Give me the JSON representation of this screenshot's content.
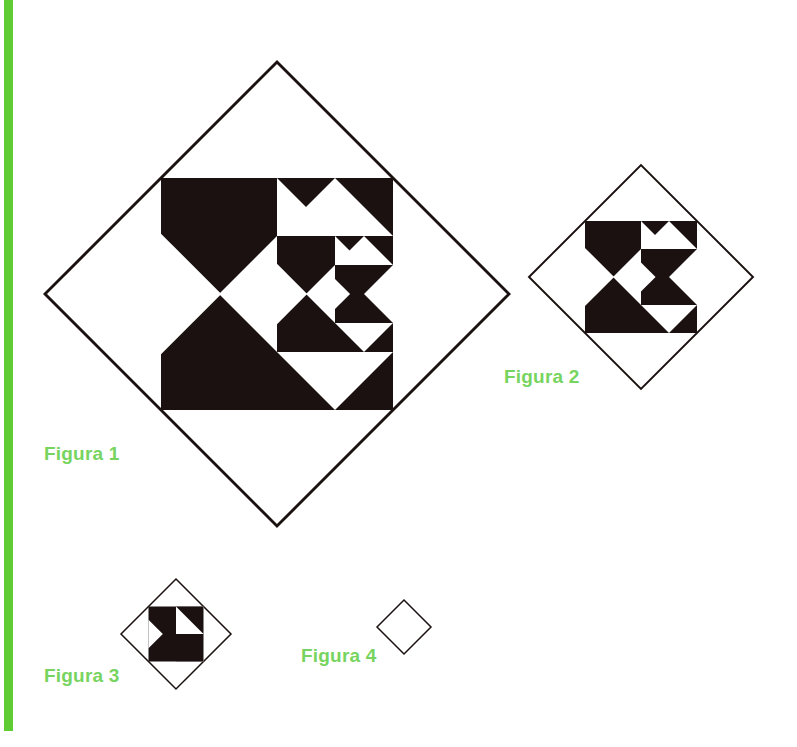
{
  "page": {
    "background_color": "#ffffff",
    "accent_color": "#5fcc33",
    "label_color": "#77d45f",
    "shape_fill": "#1a1110",
    "shape_stroke": "#1a1110",
    "width": 797,
    "height": 747
  },
  "sidebar": {
    "stripe_color": "#5fcc33"
  },
  "figures": [
    {
      "id": "figure-1",
      "label": "Figura 1",
      "depth": 3,
      "center": {
        "x": 277,
        "y": 294
      },
      "half_diagonal": 232,
      "label_position": {
        "x": 44,
        "y": 443
      }
    },
    {
      "id": "figure-2",
      "label": "Figura 2",
      "depth": 2,
      "center": {
        "x": 641,
        "y": 277
      },
      "half_diagonal": 112,
      "label_position": {
        "x": 504,
        "y": 366
      }
    },
    {
      "id": "figure-3",
      "label": "Figura 3",
      "depth": 1,
      "center": {
        "x": 176,
        "y": 634
      },
      "half_diagonal": 55,
      "label_position": {
        "x": 44,
        "y": 665
      }
    },
    {
      "id": "figure-4",
      "label": "Figura 4",
      "depth": 0,
      "center": {
        "x": 404,
        "y": 627
      },
      "half_diagonal": 27,
      "label_position": {
        "x": 301,
        "y": 645
      }
    }
  ],
  "chart_data": {
    "type": "diagram",
    "title": "",
    "sequence_labels": [
      "Figura 1",
      "Figura 2",
      "Figura 3",
      "Figura 4"
    ],
    "recursion_depths": [
      3,
      2,
      1,
      0
    ],
    "half_diagonals": [
      232,
      112,
      55,
      27
    ],
    "scale_ratio": 0.5,
    "motif": "diamond outline with inscribed black square bearing a triangular notch; the right half of the notch contains the next smaller iteration"
  }
}
